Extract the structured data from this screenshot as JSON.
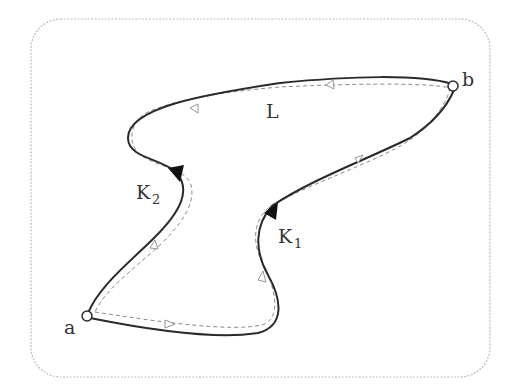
{
  "diagram": {
    "points": {
      "start": {
        "label": "a"
      },
      "end": {
        "label": "b"
      }
    },
    "paths": [
      {
        "id": "K1",
        "label": "K",
        "subscript": "1",
        "from": "a",
        "to": "b",
        "style": "solid",
        "arrow": "filled"
      },
      {
        "id": "K2",
        "label": "K",
        "subscript": "2",
        "from": "a",
        "to": "b",
        "style": "solid",
        "arrow": "filled"
      }
    ],
    "loop": {
      "label": "L",
      "style": "dashed",
      "orientation": "a → K1 → b → K2 reversed → a",
      "arrow": "hollow"
    },
    "colors": {
      "curve": "#2a2a2a",
      "loop": "#8a8a8a",
      "frame": "#b9b9b9",
      "background": "#ffffff"
    }
  }
}
